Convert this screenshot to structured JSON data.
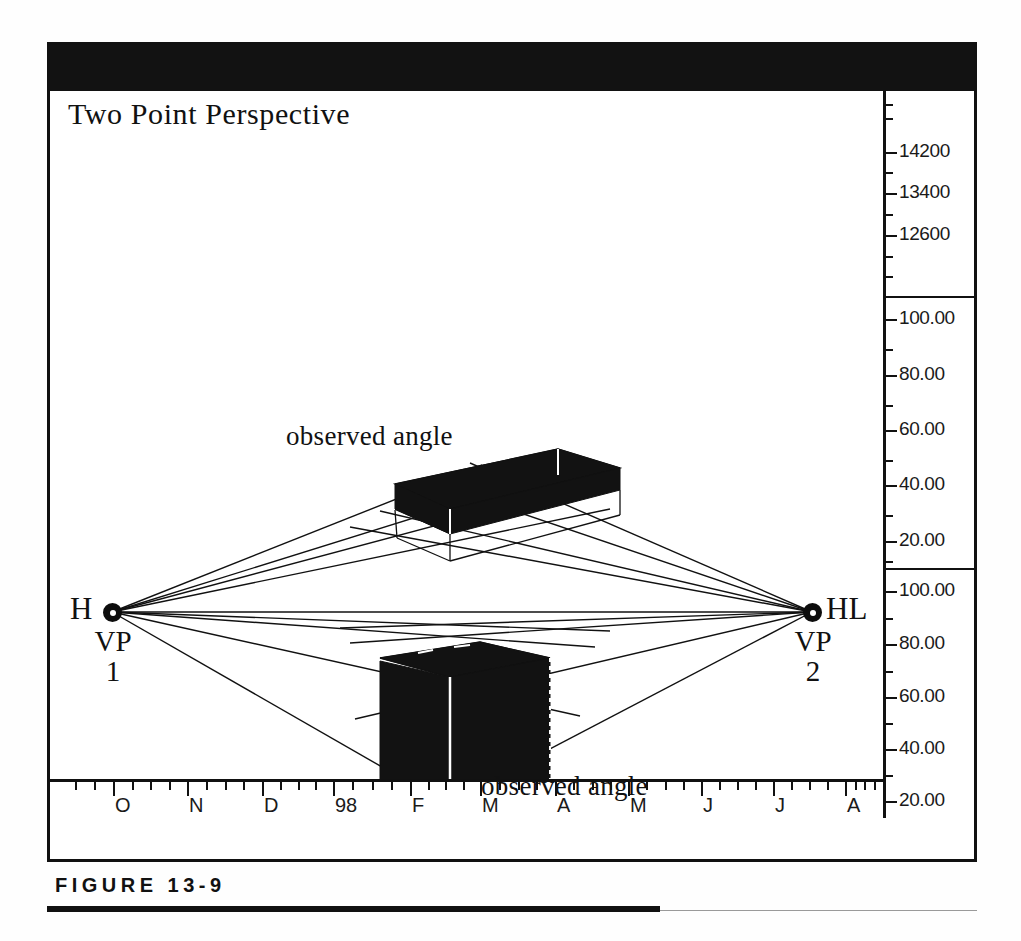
{
  "figure": {
    "caption": "FIGURE 13-9"
  },
  "chart": {
    "title": "Two Point Perspective",
    "annotations": [
      {
        "text": "observed angle",
        "x": 283,
        "y": 377
      },
      {
        "text": "observed angle",
        "x": 478,
        "y": 727
      }
    ],
    "vanishing_points": {
      "left": {
        "side_label": "H",
        "name": "VP",
        "index": "1"
      },
      "right": {
        "side_label": "HL",
        "name": "VP",
        "index": "2"
      }
    }
  },
  "chart_data": {
    "type": "line",
    "title": "Two Point Perspective",
    "xlabel": "",
    "ylabel": "",
    "grid": false,
    "legend": null,
    "x_axis": {
      "tick_labels": [
        "O",
        "N",
        "D",
        "98",
        "F",
        "M",
        "A",
        "M",
        "J",
        "J",
        "A"
      ],
      "minor_ticks_per_major": 3
    },
    "y_axes": [
      {
        "name": "upper-volume-scale",
        "tick_labels": [
          "14200",
          "13400",
          "12600"
        ],
        "values": [
          14200,
          13400,
          12600
        ]
      },
      {
        "name": "middle-percent-scale",
        "tick_labels": [
          "100.00",
          "80.00",
          "60.00",
          "40.00",
          "20.00"
        ],
        "values": [
          100.0,
          80.0,
          60.0,
          40.0,
          20.0
        ]
      },
      {
        "name": "lower-percent-scale",
        "tick_labels": [
          "100.00",
          "80.00",
          "60.00",
          "40.00",
          "20.00"
        ],
        "values": [
          100.0,
          80.0,
          60.0,
          40.0,
          20.0
        ]
      }
    ],
    "series": [
      {
        "name": "upper observed angle block",
        "description": "black slab drawn in two point perspective above the horizon line",
        "x": [
          430,
          545,
          610,
          495
        ],
        "y": [
          420,
          404,
          432,
          450
        ]
      },
      {
        "name": "lower observed angle block",
        "description": "black box drawn in two point perspective below the horizon line",
        "x": [
          355,
          470,
          540,
          430
        ],
        "y": [
          590,
          575,
          600,
          760
        ]
      },
      {
        "name": "horizon line",
        "description": "HL connecting VP1 and VP2",
        "x": [
          110,
          810
        ],
        "y": [
          568,
          568
        ]
      }
    ],
    "colors": {
      "ink": "#111111",
      "paper": "#ffffff",
      "fill": "#121212"
    }
  },
  "scales": {
    "panels": [
      {
        "name": "upper-volume-scale",
        "top": 0,
        "height": 205,
        "ticks": [
          {
            "type": "minor",
            "y": 14
          },
          {
            "type": "minor",
            "y": 28
          },
          {
            "type": "major",
            "y": 62,
            "label": "14200"
          },
          {
            "type": "minor",
            "y": 82
          },
          {
            "type": "major",
            "y": 103,
            "label": "13400"
          },
          {
            "type": "minor",
            "y": 124
          },
          {
            "type": "major",
            "y": 145,
            "label": "12600"
          },
          {
            "type": "minor",
            "y": 166
          },
          {
            "type": "minor",
            "y": 186
          }
        ]
      },
      {
        "name": "middle-percent-scale",
        "top": 205,
        "height": 272,
        "ticks": [
          {
            "type": "major",
            "y": 22,
            "label": "100.00"
          },
          {
            "type": "minor",
            "y": 52
          },
          {
            "type": "major",
            "y": 78,
            "label": "80.00"
          },
          {
            "type": "minor",
            "y": 108
          },
          {
            "type": "major",
            "y": 133,
            "label": "60.00"
          },
          {
            "type": "minor",
            "y": 163
          },
          {
            "type": "major",
            "y": 188,
            "label": "40.00"
          },
          {
            "type": "minor",
            "y": 218
          },
          {
            "type": "major",
            "y": 244,
            "label": "20.00"
          },
          {
            "type": "minor",
            "y": 264
          }
        ]
      },
      {
        "name": "lower-percent-scale",
        "top": 477,
        "height": 250,
        "ticks": [
          {
            "type": "major",
            "y": 22,
            "label": "100.00"
          },
          {
            "type": "minor",
            "y": 49
          },
          {
            "type": "major",
            "y": 75,
            "label": "80.00"
          },
          {
            "type": "minor",
            "y": 102
          },
          {
            "type": "major",
            "y": 128,
            "label": "60.00"
          },
          {
            "type": "minor",
            "y": 154
          },
          {
            "type": "major",
            "y": 180,
            "label": "40.00"
          },
          {
            "type": "minor",
            "y": 206
          },
          {
            "type": "major",
            "y": 232,
            "label": "20.00"
          }
        ]
      }
    ]
  },
  "x_axis": {
    "labels": [
      {
        "text": "O",
        "x": 63
      },
      {
        "text": "N",
        "x": 137
      },
      {
        "text": "D",
        "x": 212
      },
      {
        "text": "98",
        "x": 283
      },
      {
        "text": "F",
        "x": 360
      },
      {
        "text": "M",
        "x": 430
      },
      {
        "text": "A",
        "x": 505
      },
      {
        "text": "M",
        "x": 578
      },
      {
        "text": "J",
        "x": 651
      },
      {
        "text": "J",
        "x": 723
      },
      {
        "text": "A",
        "x": 795
      }
    ]
  }
}
